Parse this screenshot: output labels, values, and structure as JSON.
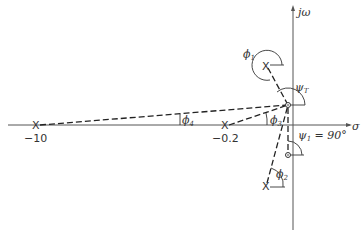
{
  "axes": {
    "x_label": "σ",
    "y_label": "jω"
  },
  "points": {
    "pole_far": {
      "marker": "X",
      "label": "−10"
    },
    "pole_near": {
      "marker": "X",
      "label": "−0.2"
    },
    "pole_upper": {
      "marker": "X"
    },
    "pole_lower": {
      "marker": "X"
    },
    "test_point": {
      "marker": "circle"
    },
    "zero": {
      "marker": "circle"
    }
  },
  "angles": {
    "phi1": {
      "sym": "ϕ",
      "sub": "1"
    },
    "phi2": {
      "sym": "ϕ",
      "sub": "2"
    },
    "phi3": {
      "sym": "ϕ",
      "sub": "3"
    },
    "phi4": {
      "sym": "ϕ",
      "sub": "4"
    },
    "psiT": {
      "sym": "ψ",
      "sub": "T"
    },
    "psi1": {
      "sym": "ψ",
      "sub": "1",
      "value": " = 90°"
    }
  }
}
